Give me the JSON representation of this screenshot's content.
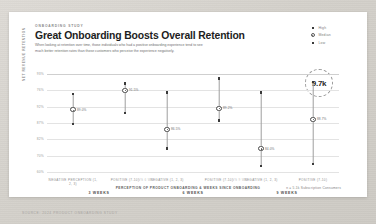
{
  "header": {
    "eyebrow": "ONBOARDING STUDY",
    "title": "Great Onboarding Boosts Overall Retention",
    "subtitle": "When looking at retention over time, those individuals who had a positive onboarding experience tend to see much better retention rates than those customers who perceive the experience negatively."
  },
  "legend": {
    "items": [
      {
        "label": "High",
        "marker": "square-icon"
      },
      {
        "label": "Median",
        "marker": "circle-icon"
      },
      {
        "label": "Low",
        "marker": "square-icon"
      }
    ]
  },
  "callout": {
    "value": "9.7k"
  },
  "footer": {
    "source": "SOURCE: 2024 PRODUCT ONBOARDING STUDY",
    "caption": "PERCEPTION OF PRODUCT ONBOARDING & WEEKS SINCE ONBOARDING",
    "sample_note": "n = 5.1k Subscription Consumers"
  },
  "chart_data": {
    "type": "scatter",
    "title": "Great Onboarding Boosts Overall Retention",
    "xlabel": "PERCEPTION OF PRODUCT ONBOARDING & WEEKS SINCE ONBOARDING",
    "ylabel": "NET REVENUE RETENTION",
    "ylim": [
      60,
      93
    ],
    "yticks": [
      "93%",
      "76%",
      "92%",
      "87%",
      "82%",
      "70%",
      "60%"
    ],
    "ytick_values": [
      93,
      76,
      92,
      87,
      82,
      70,
      60
    ],
    "grid": true,
    "legend_position": "top-right",
    "groups": [
      {
        "group_label": "3 WEEKS",
        "points": [
          {
            "category": "NEGATIVE PERCEPTION (1, 2, 3)",
            "median": 89.0,
            "median_label": "89.0%",
            "high": 91.0,
            "low": 87.2
          },
          {
            "category": "POSITIVE (7-10)",
            "median": 91.5,
            "median_label": "91.5%",
            "high": 92.4,
            "low": 88.6
          }
        ]
      },
      {
        "group_label": "6 WEEKS",
        "points": [
          {
            "category": "NEGATIVE (1, 2, 3)",
            "median": 86.5,
            "median_label": "86.5%",
            "high": 91.2,
            "low": 84.0
          },
          {
            "category": "POSITIVE (7-10)",
            "median": 89.2,
            "median_label": "89.2%",
            "high": 93.0,
            "low": 87.6
          }
        ]
      },
      {
        "group_label": "9 WEEKS",
        "points": [
          {
            "category": "NEGATIVE (1, 2, 3)",
            "median": 84.0,
            "median_label": "84.0%",
            "high": 91.2,
            "low": 81.8
          },
          {
            "category": "POSITIVE (7-10)",
            "median": 87.8,
            "median_label": "88.7%",
            "high": 92.6,
            "low": 82.0
          }
        ]
      }
    ],
    "separators": [
      "vs 6 WK",
      "vs 9 WK"
    ]
  },
  "colors": {
    "ink": "#1d1d1d",
    "muted": "#8d8d8d",
    "marker": "#3a3a3a",
    "grid": "#e3e3e3",
    "card": "#ffffff",
    "page": "#d4d1cb"
  }
}
